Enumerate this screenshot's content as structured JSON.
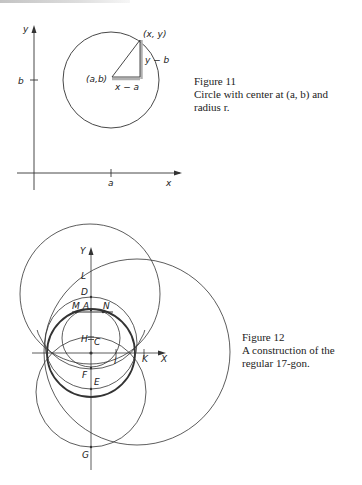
{
  "figure11": {
    "caption_title": "Figure 11",
    "caption_line1": "Circle with center at (a, b) and",
    "caption_line2": "radius r.",
    "labels": {
      "y_axis": "y",
      "x_axis": "x",
      "b_tick": "b",
      "a_tick": "a",
      "point_xy": "(x, y)",
      "center_ab": "(a,b)",
      "leg_horizontal": "x − a",
      "leg_vertical": "y − b"
    }
  },
  "figure12": {
    "caption_title": "Figure 12",
    "caption_line1": "A construction of the",
    "caption_line2": "regular 17-gon.",
    "labels": {
      "y_axis": "Y",
      "x_axis": "X",
      "L": "L",
      "D": "D",
      "M": "M",
      "A": "A",
      "N": "N",
      "H": "H",
      "C": "C",
      "I": "I",
      "K": "K",
      "F": "F",
      "E": "E",
      "G": "G"
    }
  },
  "colors": {
    "ink": "#333333",
    "highlight": "#b0b0b0",
    "background": "#ffffff"
  }
}
